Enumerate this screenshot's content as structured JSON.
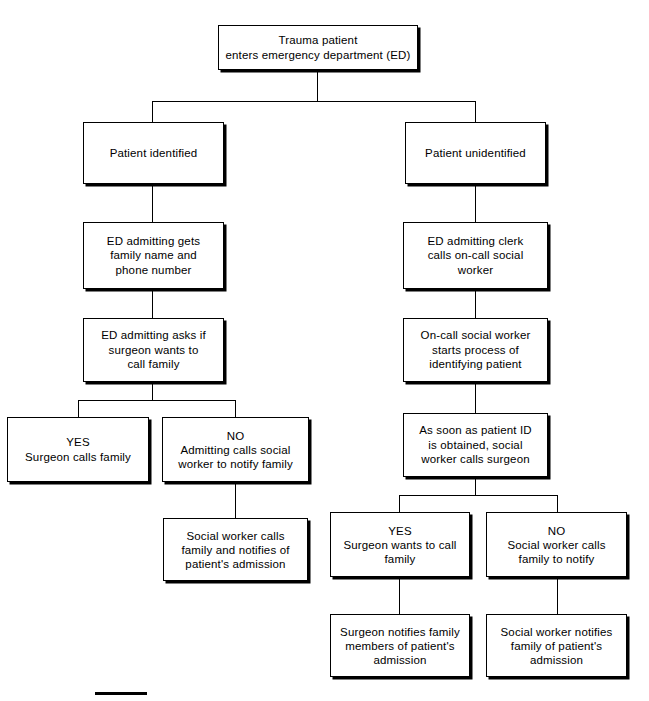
{
  "figure": {
    "type": "flowchart",
    "background_color": "#ffffff",
    "line_color": "#000000",
    "box_fill": "#ffffff"
  },
  "nodes": {
    "start": {
      "id": "start",
      "text": "Trauma patient\nenters emergency department (ED)"
    },
    "left_identified": {
      "id": "left_identified",
      "text": "Patient identified"
    },
    "left_admitting_gets": {
      "id": "left_admitting_gets",
      "text": "ED admitting gets\nfamily name and\nphone number"
    },
    "left_admitting_asks": {
      "id": "left_admitting_asks",
      "text": "ED admitting asks if\nsurgeon wants to\ncall family"
    },
    "left_yes": {
      "id": "left_yes",
      "text": "YES\nSurgeon calls family"
    },
    "left_no": {
      "id": "left_no",
      "text": "NO\nAdmitting calls social\nworker to notify family"
    },
    "left_social_calls": {
      "id": "left_social_calls",
      "text": "Social worker calls\nfamily and notifies of\npatient's admission"
    },
    "right_unidentified": {
      "id": "right_unidentified",
      "text": "Patient unidentified"
    },
    "right_clerk_calls": {
      "id": "right_clerk_calls",
      "text": "ED admitting clerk\ncalls on-call social worker"
    },
    "right_starts_process": {
      "id": "right_starts_process",
      "text": "On-call social worker\nstarts process of\nidentifying patient"
    },
    "right_id_obtained": {
      "id": "right_id_obtained",
      "text": "As soon as patient ID\nis obtained, social\nworker calls surgeon"
    },
    "right_yes": {
      "id": "right_yes",
      "text": "YES\nSurgeon wants to call\nfamily"
    },
    "right_no": {
      "id": "right_no",
      "text": "NO\nSocial worker calls\nfamily to notify"
    },
    "right_surgeon_notifies": {
      "id": "right_surgeon_notifies",
      "text": "Surgeon notifies family\nmembers of patient's\nadmission"
    },
    "right_social_notifies": {
      "id": "right_social_notifies",
      "text": "Social worker notifies\nfamily of patient's\nadmission"
    }
  }
}
